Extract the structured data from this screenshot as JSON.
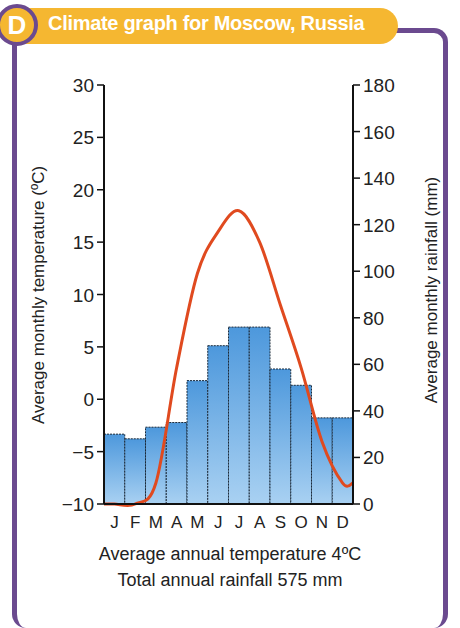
{
  "header": {
    "badge": "D",
    "title": "Climate graph for Moscow, Russia"
  },
  "footer": {
    "line1": "Average annual temperature 4ºC",
    "line2": "Total annual rainfall 575 mm"
  },
  "colors": {
    "frame": "#6b4a8f",
    "banner": "#f5b731",
    "bar": "#5aa2df",
    "line": "#e04a1f"
  },
  "chart_data": {
    "type": "bar+line",
    "title": "Climate graph for Moscow, Russia",
    "categories": [
      "J",
      "F",
      "M",
      "A",
      "M",
      "J",
      "J",
      "A",
      "S",
      "O",
      "N",
      "D"
    ],
    "series": [
      {
        "name": "Average monthly rainfall (mm)",
        "type": "bar",
        "axis": "right",
        "values": [
          30,
          28,
          33,
          35,
          53,
          68,
          76,
          76,
          58,
          51,
          37,
          37
        ]
      },
      {
        "name": "Average monthly temperature (ºC)",
        "type": "line",
        "axis": "left",
        "values": [
          -10,
          -10,
          -8,
          3,
          12,
          16,
          18,
          15,
          9,
          3,
          -4,
          -8
        ]
      }
    ],
    "ylabel_left": "Average monthly temperature (ºC)",
    "ylabel_right": "Average monthly rainfall (mm)",
    "ylim_left": [
      -10,
      30
    ],
    "yticks_left": [
      -10,
      -5,
      0,
      5,
      10,
      15,
      20,
      25,
      30
    ],
    "ylim_right": [
      0,
      180
    ],
    "yticks_right": [
      0,
      20,
      40,
      60,
      80,
      100,
      120,
      140,
      160,
      180
    ],
    "grid": false,
    "annotations": [
      "Average annual temperature 4ºC",
      "Total annual rainfall 575 mm"
    ]
  }
}
